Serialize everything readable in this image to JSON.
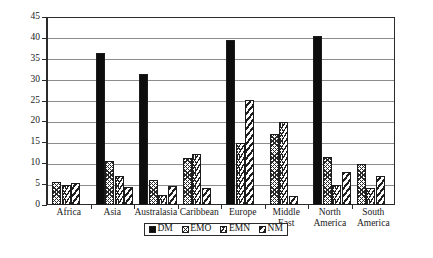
{
  "chart_data": {
    "type": "bar",
    "title": "",
    "subtitle": "",
    "xlabel": "",
    "ylabel": "",
    "ylim": [
      0,
      45
    ],
    "yticks": [
      0,
      5,
      10,
      15,
      20,
      25,
      30,
      35,
      40,
      45
    ],
    "grid": true,
    "grid_axis": "y",
    "legend_position": "bottom-center",
    "categories": [
      "Africa",
      "Asia",
      "Australasia",
      "Caribbean",
      "Europe",
      "Middle East",
      "North America",
      "South America"
    ],
    "series": [
      {
        "name": "DM",
        "pattern": "solid-black",
        "values": [
          null,
          36.5,
          31.3,
          null,
          39.4,
          null,
          40.4,
          null
        ]
      },
      {
        "name": "EMO",
        "pattern": "cross-hatch",
        "values": [
          5.4,
          10.6,
          6.0,
          11.3,
          null,
          17.0,
          11.4,
          9.8
        ]
      },
      {
        "name": "EMN",
        "pattern": "chevron",
        "values": [
          4.9,
          7.0,
          2.4,
          12.2,
          14.8,
          19.8,
          4.9,
          4.1
        ]
      },
      {
        "name": "NM",
        "pattern": "diagonal-stripe",
        "values": [
          5.2,
          4.3,
          4.6,
          4.0,
          25.2,
          2.2,
          7.8,
          7.0
        ]
      }
    ]
  },
  "legend": {
    "items": [
      {
        "label": "DM"
      },
      {
        "label": "EMO"
      },
      {
        "label": "EMN"
      },
      {
        "label": "NM"
      }
    ]
  }
}
